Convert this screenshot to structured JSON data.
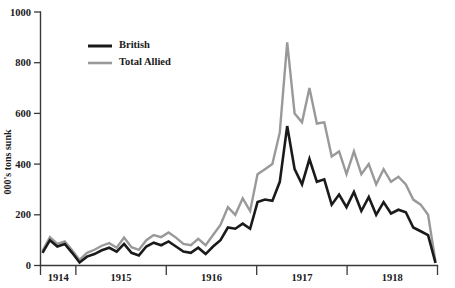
{
  "chart_data": {
    "type": "line",
    "title": "",
    "xlabel": "",
    "ylabel": "000's tons sunk",
    "ylim": [
      0,
      1000
    ],
    "yticks": [
      0,
      200,
      400,
      600,
      800,
      1000
    ],
    "ytick_labels": [
      "0",
      "200",
      "400",
      "600",
      "800",
      "1000"
    ],
    "grid": false,
    "legend_position": "top-left",
    "x_group_labels": [
      "1914",
      "1915",
      "1916",
      "1917",
      "1918"
    ],
    "x_unit": "month",
    "x_start": "1914-08",
    "x_end": "1918-11",
    "series": [
      {
        "name": "British",
        "color": "#1a1a1a",
        "line_width": 2.6,
        "values": [
          50,
          100,
          75,
          85,
          50,
          12,
          35,
          45,
          60,
          70,
          55,
          85,
          50,
          40,
          75,
          90,
          80,
          95,
          75,
          55,
          50,
          70,
          45,
          75,
          100,
          150,
          145,
          165,
          145,
          250,
          260,
          255,
          330,
          550,
          380,
          320,
          420,
          330,
          340,
          240,
          280,
          230,
          290,
          215,
          270,
          200,
          250,
          205,
          220,
          210,
          150,
          135,
          120,
          10
        ]
      },
      {
        "name": "Total Allied",
        "color": "#999999",
        "line_width": 2.4,
        "values": [
          58,
          112,
          85,
          95,
          60,
          22,
          50,
          62,
          78,
          88,
          70,
          110,
          72,
          62,
          100,
          120,
          112,
          130,
          110,
          85,
          80,
          105,
          80,
          120,
          160,
          230,
          200,
          265,
          215,
          360,
          380,
          400,
          525,
          880,
          600,
          565,
          700,
          560,
          565,
          430,
          450,
          360,
          450,
          360,
          400,
          320,
          380,
          330,
          350,
          320,
          260,
          240,
          200,
          15
        ]
      }
    ],
    "legend": [
      {
        "label": "British",
        "color": "#1a1a1a"
      },
      {
        "label": "Total Allied",
        "color": "#999999"
      }
    ]
  },
  "axes": {
    "y_axis_name": "y-axis",
    "x_axis_name": "x-axis"
  }
}
